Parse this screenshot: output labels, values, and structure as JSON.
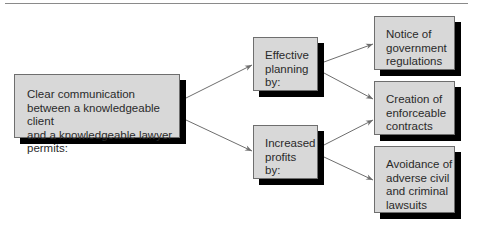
{
  "diagram": {
    "type": "flowchart",
    "root": {
      "text": "Clear communication\nbetween a knowledgeable client\nand a knowledgeable lawyer\npermits:"
    },
    "middle": [
      {
        "text": "Effective\nplanning\nby:"
      },
      {
        "text": "Increased\nprofits\nby:"
      }
    ],
    "outcomes": [
      {
        "text": "Notice of\ngovernment\nregulations"
      },
      {
        "text": "Creation of\nenforceable\ncontracts"
      },
      {
        "text": "Avoidance of\nadverse civil\nand criminal\nlawsuits"
      }
    ],
    "edges": [
      {
        "from": "root",
        "to": "middle.0"
      },
      {
        "from": "root",
        "to": "middle.1"
      },
      {
        "from": "middle.0",
        "to": "outcomes.0"
      },
      {
        "from": "middle.0",
        "to": "outcomes.1"
      },
      {
        "from": "middle.1",
        "to": "outcomes.1"
      },
      {
        "from": "middle.1",
        "to": "outcomes.2"
      }
    ],
    "colors": {
      "box_fill": "#d8d8d8",
      "box_shadow": "#000000",
      "arrow": "#6e6e6e",
      "text": "#2a2a2a"
    }
  }
}
